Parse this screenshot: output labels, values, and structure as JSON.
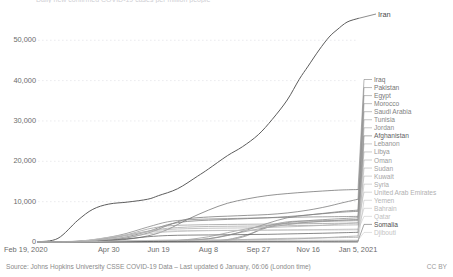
{
  "chart_data": {
    "type": "line",
    "title": "Daily new confirmed COVID-19 cases per million people",
    "xlabel": "",
    "ylabel": "",
    "grid": true,
    "legend_position": "right",
    "xlim": [
      0,
      321
    ],
    "ylim": [
      0,
      58000
    ],
    "y_ticks": [
      {
        "value": 50000,
        "label": "50,000"
      },
      {
        "value": 40000,
        "label": "40,000"
      },
      {
        "value": 30000,
        "label": "30,000"
      },
      {
        "value": 20000,
        "label": "20,000"
      },
      {
        "value": 10000,
        "label": "10,000"
      },
      {
        "value": 0,
        "label": "0"
      }
    ],
    "x_ticks": [
      {
        "value": 0,
        "label": "Feb 19, 2020"
      },
      {
        "value": 71,
        "label": "Apr 30"
      },
      {
        "value": 121,
        "label": "Jun 19"
      },
      {
        "value": 171,
        "label": "Aug 8"
      },
      {
        "value": 221,
        "label": "Sep 27"
      },
      {
        "value": 271,
        "label": "Nov 16"
      },
      {
        "value": 321,
        "label": "Jan 5, 2021"
      }
    ],
    "highlight_label": "Iran",
    "series": [
      {
        "name": "Iran",
        "color": "#5c5c5c",
        "highlight": true,
        "x": [
          0,
          20,
          40,
          55,
          71,
          90,
          110,
          121,
          140,
          160,
          171,
          190,
          205,
          221,
          235,
          250,
          262,
          271,
          282,
          292,
          300,
          310,
          321
        ],
        "values": [
          60,
          900,
          5400,
          8100,
          9400,
          9900,
          10600,
          11500,
          13200,
          16300,
          18100,
          21400,
          23600,
          26600,
          30400,
          35200,
          40300,
          43600,
          47600,
          50800,
          52600,
          54500,
          55400
        ]
      },
      {
        "name": "Iraq",
        "color": "#6f6f6f",
        "x": [
          0,
          40,
          80,
          110,
          130,
          150,
          171,
          190,
          210,
          230,
          250,
          271,
          290,
          305,
          321
        ],
        "values": [
          10,
          130,
          450,
          1500,
          3100,
          5600,
          7900,
          9600,
          10700,
          11500,
          12000,
          12400,
          12700,
          12900,
          13000
        ]
      },
      {
        "name": "Pakistan",
        "color": "#747474",
        "x": [
          0,
          40,
          80,
          110,
          130,
          150,
          171,
          190,
          210,
          230,
          250,
          271,
          290,
          305,
          321
        ],
        "values": [
          5,
          120,
          700,
          2200,
          4100,
          5700,
          6200,
          6400,
          6600,
          6800,
          7200,
          7900,
          8800,
          9700,
          10600
        ]
      },
      {
        "name": "Egypt",
        "color": "#797979",
        "x": [
          0,
          40,
          80,
          110,
          130,
          150,
          171,
          190,
          210,
          230,
          250,
          271,
          290,
          305,
          321
        ],
        "values": [
          5,
          180,
          900,
          2600,
          4300,
          5100,
          5400,
          5600,
          5800,
          6000,
          6300,
          6700,
          7200,
          7600,
          7900
        ]
      },
      {
        "name": "Morocco",
        "color": "#7e7e7e",
        "x": [
          0,
          40,
          80,
          110,
          130,
          150,
          171,
          190,
          210,
          230,
          250,
          271,
          290,
          305,
          321
        ],
        "values": [
          2,
          160,
          210,
          240,
          310,
          460,
          800,
          1600,
          3000,
          4600,
          6000,
          6700,
          7100,
          7400,
          7600
        ]
      },
      {
        "name": "Saudi Arabia",
        "color": "#838383",
        "x": [
          0,
          40,
          80,
          110,
          130,
          150,
          171,
          190,
          210,
          230,
          250,
          271,
          290,
          305,
          321
        ],
        "values": [
          0,
          90,
          1600,
          3700,
          5000,
          5500,
          5700,
          5800,
          5900,
          6000,
          6100,
          6200,
          6250,
          6300,
          6350
        ]
      },
      {
        "name": "Tunisia",
        "color": "#888888",
        "x": [
          0,
          40,
          80,
          110,
          130,
          150,
          171,
          190,
          210,
          230,
          250,
          271,
          290,
          305,
          321
        ],
        "values": [
          0,
          60,
          80,
          90,
          95,
          110,
          200,
          600,
          1800,
          3600,
          4800,
          5300,
          5600,
          5800,
          6000
        ]
      },
      {
        "name": "Jordan",
        "color": "#8d8d8d",
        "x": [
          0,
          40,
          80,
          110,
          130,
          150,
          171,
          190,
          210,
          230,
          250,
          271,
          290,
          305,
          321
        ],
        "values": [
          0,
          30,
          40,
          45,
          50,
          70,
          120,
          400,
          1600,
          3900,
          5000,
          5200,
          5300,
          5400,
          5500
        ]
      },
      {
        "name": "Afghanistan",
        "color": "#5f5f5f",
        "x": [
          0,
          40,
          80,
          110,
          130,
          150,
          171,
          190,
          210,
          230,
          250,
          271,
          290,
          305,
          321
        ],
        "values": [
          0,
          40,
          600,
          1300,
          1600,
          1700,
          1750,
          1800,
          1850,
          1900,
          2000,
          2100,
          2200,
          2300,
          2400
        ]
      },
      {
        "name": "Lebanon",
        "color": "#929292",
        "x": [
          0,
          40,
          80,
          110,
          130,
          150,
          171,
          190,
          210,
          230,
          250,
          271,
          290,
          305,
          321
        ],
        "values": [
          0,
          60,
          90,
          110,
          160,
          330,
          800,
          1700,
          2700,
          3600,
          4300,
          4900,
          5200,
          5400,
          5600
        ]
      },
      {
        "name": "Libya",
        "color": "#979797",
        "x": [
          0,
          40,
          80,
          110,
          130,
          150,
          171,
          190,
          210,
          230,
          250,
          271,
          290,
          305,
          321
        ],
        "values": [
          0,
          5,
          20,
          60,
          200,
          600,
          1300,
          2300,
          3300,
          4100,
          4600,
          4900,
          5100,
          5200,
          5300
        ]
      },
      {
        "name": "Oman",
        "color": "#9c9c9c",
        "x": [
          0,
          40,
          80,
          110,
          130,
          150,
          171,
          190,
          210,
          230,
          250,
          271,
          290,
          305,
          321
        ],
        "values": [
          0,
          150,
          1300,
          3200,
          4000,
          4200,
          4300,
          4350,
          4400,
          4450,
          4500,
          4550,
          4600,
          4650,
          4700
        ]
      },
      {
        "name": "Sudan",
        "color": "#a1a1a1",
        "x": [
          0,
          40,
          80,
          110,
          130,
          150,
          171,
          190,
          210,
          230,
          250,
          271,
          290,
          305,
          321
        ],
        "values": [
          0,
          20,
          150,
          350,
          450,
          500,
          520,
          540,
          560,
          600,
          700,
          900,
          1100,
          1300,
          1500
        ]
      },
      {
        "name": "Kuwait",
        "color": "#a6a6a6",
        "x": [
          0,
          40,
          80,
          110,
          130,
          150,
          171,
          190,
          210,
          230,
          250,
          271,
          290,
          305,
          321
        ],
        "values": [
          0,
          120,
          1200,
          2700,
          3400,
          3700,
          3850,
          3900,
          3950,
          4000,
          4050,
          4100,
          4150,
          4200,
          4250
        ]
      },
      {
        "name": "Syria",
        "color": "#ababab",
        "x": [
          0,
          40,
          80,
          110,
          130,
          150,
          171,
          190,
          210,
          230,
          250,
          271,
          290,
          305,
          321
        ],
        "values": [
          0,
          2,
          5,
          15,
          40,
          100,
          250,
          450,
          650,
          800,
          900,
          980,
          1050,
          1100,
          1150
        ]
      },
      {
        "name": "United Arab Emirates",
        "color": "#b0b0b0",
        "x": [
          0,
          40,
          80,
          110,
          130,
          150,
          171,
          190,
          210,
          230,
          250,
          271,
          290,
          305,
          321
        ],
        "values": [
          0,
          200,
          1400,
          2600,
          3100,
          3300,
          3400,
          3450,
          3500,
          3600,
          3750,
          3950,
          4200,
          4500,
          4800
        ]
      },
      {
        "name": "Yemen",
        "color": "#b5b5b5",
        "x": [
          0,
          40,
          80,
          110,
          130,
          150,
          171,
          190,
          210,
          230,
          250,
          271,
          290,
          305,
          321
        ],
        "values": [
          0,
          1,
          5,
          20,
          45,
          60,
          70,
          75,
          78,
          80,
          82,
          84,
          86,
          88,
          90
        ]
      },
      {
        "name": "Bahrain",
        "color": "#bababa",
        "x": [
          0,
          40,
          80,
          110,
          130,
          150,
          171,
          190,
          210,
          230,
          250,
          271,
          290,
          305,
          321
        ],
        "values": [
          0,
          100,
          900,
          2000,
          2500,
          2700,
          2800,
          2850,
          2900,
          2950,
          3000,
          3050,
          3100,
          3150,
          3200
        ]
      },
      {
        "name": "Qatar",
        "color": "#bfbfbf",
        "x": [
          0,
          40,
          80,
          110,
          130,
          150,
          171,
          190,
          210,
          230,
          250,
          271,
          290,
          305,
          321
        ],
        "values": [
          0,
          180,
          1500,
          2400,
          2700,
          2800,
          2850,
          2880,
          2900,
          2920,
          2940,
          2960,
          2980,
          3000,
          3020
        ]
      },
      {
        "name": "Somalia",
        "color": "#4f4f4f",
        "x": [
          0,
          40,
          80,
          110,
          130,
          150,
          171,
          190,
          210,
          230,
          250,
          271,
          290,
          305,
          321
        ],
        "values": [
          0,
          5,
          60,
          120,
          150,
          160,
          165,
          170,
          175,
          180,
          185,
          195,
          210,
          230,
          250
        ]
      },
      {
        "name": "Djibouti",
        "color": "#c4c4c4",
        "x": [
          0,
          40,
          80,
          110,
          130,
          150,
          171,
          190,
          210,
          230,
          250,
          271,
          290,
          305,
          321
        ],
        "values": [
          0,
          30,
          250,
          380,
          420,
          430,
          435,
          438,
          440,
          442,
          445,
          448,
          450,
          452,
          455
        ]
      }
    ]
  },
  "footer": {
    "source": "Source: Johns Hopkins University CSSE COVID-19 Data – Last updated 6 January, 06:06 (London time)",
    "license": "CC BY"
  }
}
